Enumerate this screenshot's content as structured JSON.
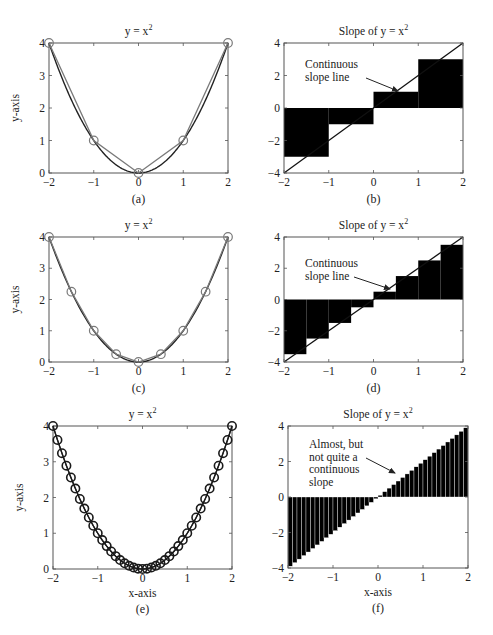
{
  "figure": {
    "width": 493,
    "height": 635,
    "colors": {
      "axis": "#555555",
      "curve": "#222222",
      "approx_gray": "#7a7a7a",
      "bar_fill": "#000000",
      "marker_dark": "#1a1a1a"
    }
  },
  "chart_data": [
    {
      "id": "a",
      "type": "line",
      "caption": "(a)",
      "title": "y = x",
      "title_sup": "2",
      "xlabel": "",
      "ylabel": "y-axis",
      "xlim": [
        -2,
        2
      ],
      "ylim": [
        0,
        4
      ],
      "xticks": [
        -2,
        -1,
        0,
        1,
        2
      ],
      "yticks": [
        0,
        1,
        2,
        3,
        4
      ],
      "xtick_labels": [
        "−2",
        "−1",
        "0",
        "1",
        "2"
      ],
      "ytick_labels": [
        "0",
        "1",
        "2",
        "3",
        "4"
      ],
      "box": {
        "x": 49,
        "y": 43,
        "w": 179,
        "h": 130
      },
      "grid": false,
      "series": [
        {
          "name": "y = x^2 (continuous)",
          "style": "curve",
          "function": "x^2"
        },
        {
          "name": "sampled points",
          "style": "markers-gray",
          "x": [
            -2,
            -1,
            0,
            1,
            2
          ],
          "y": [
            4,
            1,
            0,
            1,
            4
          ]
        }
      ]
    },
    {
      "id": "b",
      "type": "bar",
      "caption": "(b)",
      "title": "Slope of y = x",
      "title_sup": "2",
      "xlabel": "",
      "ylabel": "",
      "xlim": [
        -2,
        2
      ],
      "ylim": [
        -4,
        4
      ],
      "xticks": [
        -2,
        -1,
        0,
        1,
        2
      ],
      "yticks": [
        -4,
        -2,
        0,
        2,
        4
      ],
      "xtick_labels": [
        "−2",
        "−1",
        "0",
        "1",
        "2"
      ],
      "ytick_labels": [
        "−4",
        "−2",
        "0",
        "2",
        "4"
      ],
      "box": {
        "x": 284,
        "y": 43,
        "w": 179,
        "h": 130
      },
      "grid": false,
      "bars": {
        "x_start": [
          -2,
          -1,
          0,
          1
        ],
        "width": 1,
        "values": [
          -3,
          -1,
          1,
          3
        ]
      },
      "slope_line": {
        "x": [
          -2,
          2
        ],
        "y": [
          -4,
          4
        ],
        "label": "y' = 2x"
      },
      "annotation": {
        "lines": [
          "Continuous",
          "slope line"
        ],
        "text_x": 305,
        "text_y": 68,
        "arrow_from": [
          366,
          78
        ],
        "arrow_to": [
          398,
          91
        ]
      }
    },
    {
      "id": "c",
      "type": "line",
      "caption": "(c)",
      "title": "y = x",
      "title_sup": "2",
      "xlabel": "",
      "ylabel": "y-axis",
      "xlim": [
        -2,
        2
      ],
      "ylim": [
        0,
        4
      ],
      "xticks": [
        -2,
        -1,
        0,
        1,
        2
      ],
      "yticks": [
        0,
        1,
        2,
        3,
        4
      ],
      "xtick_labels": [
        "−2",
        "−1",
        "0",
        "1",
        "2"
      ],
      "ytick_labels": [
        "0",
        "1",
        "2",
        "3",
        "4"
      ],
      "box": {
        "x": 49,
        "y": 237,
        "w": 179,
        "h": 125
      },
      "grid": false,
      "series": [
        {
          "name": "y = x^2 (continuous)",
          "style": "curve",
          "function": "x^2"
        },
        {
          "name": "sampled points",
          "style": "markers-gray",
          "x": [
            -2,
            -1.5,
            -1,
            -0.5,
            0,
            0.5,
            1,
            1.5,
            2
          ],
          "y": [
            4,
            2.25,
            1,
            0.25,
            0,
            0.25,
            1,
            2.25,
            4
          ]
        }
      ]
    },
    {
      "id": "d",
      "type": "bar",
      "caption": "(d)",
      "title": "Slope of y = x",
      "title_sup": "2",
      "xlabel": "",
      "ylabel": "",
      "xlim": [
        -2,
        2
      ],
      "ylim": [
        -4,
        4
      ],
      "xticks": [
        -2,
        -1,
        0,
        1,
        2
      ],
      "yticks": [
        -4,
        -2,
        0,
        2,
        4
      ],
      "xtick_labels": [
        "−2",
        "−1",
        "0",
        "1",
        "2"
      ],
      "ytick_labels": [
        "−4",
        "−2",
        "0",
        "2",
        "4"
      ],
      "box": {
        "x": 284,
        "y": 237,
        "w": 179,
        "h": 125
      },
      "grid": false,
      "bars": {
        "x_start": [
          -2,
          -1.5,
          -1,
          -0.5,
          0,
          0.5,
          1,
          1.5
        ],
        "width": 0.5,
        "values": [
          -3.5,
          -2.5,
          -1.5,
          -0.5,
          0.5,
          1.5,
          2.5,
          3.5
        ]
      },
      "slope_line": {
        "x": [
          -2,
          2
        ],
        "y": [
          -4,
          4
        ],
        "label": "y' = 2x"
      },
      "annotation": {
        "lines": [
          "Continuous",
          "slope line"
        ],
        "text_x": 305,
        "text_y": 267,
        "arrow_from": [
          354,
          277
        ],
        "arrow_to": [
          390,
          289
        ]
      }
    },
    {
      "id": "e",
      "type": "line",
      "caption": "(e)",
      "title": "y = x",
      "title_sup": "2",
      "xlabel": "x-axis",
      "ylabel": "y-axis",
      "xlim": [
        -2,
        2
      ],
      "ylim": [
        0,
        4
      ],
      "xticks": [
        -2,
        -1,
        0,
        1,
        2
      ],
      "yticks": [
        0,
        1,
        2,
        3,
        4
      ],
      "xtick_labels": [
        "−2",
        "−1",
        "0",
        "1",
        "2"
      ],
      "ytick_labels": [
        "0",
        "1",
        "2",
        "3",
        "4"
      ],
      "box": {
        "x": 53,
        "y": 426,
        "w": 179,
        "h": 143
      },
      "grid": false,
      "series": [
        {
          "name": "y = x^2 (continuous)",
          "style": "curve",
          "function": "x^2"
        },
        {
          "name": "sampled points",
          "style": "markers-dark",
          "x_range": [
            -2,
            2
          ],
          "x_step": 0.1,
          "function": "x^2",
          "count": 41
        }
      ]
    },
    {
      "id": "f",
      "type": "bar",
      "caption": "(f)",
      "title": "Slope of y = x",
      "title_sup": "2",
      "xlabel": "x-axis",
      "ylabel": "",
      "xlim": [
        -2,
        2
      ],
      "ylim": [
        -4,
        4
      ],
      "xticks": [
        -2,
        -1,
        0,
        1,
        2
      ],
      "yticks": [
        -4,
        -2,
        0,
        2,
        4
      ],
      "xtick_labels": [
        "−2",
        "−1",
        "0",
        "1",
        "2"
      ],
      "ytick_labels": [
        "−4",
        "−2",
        "0",
        "2",
        "4"
      ],
      "box": {
        "x": 288,
        "y": 426,
        "w": 180,
        "h": 142
      },
      "grid": false,
      "bars": {
        "x_range": [
          -2,
          2
        ],
        "width": 0.1,
        "values_rule": "2*(x_start + width/2)",
        "count": 40
      },
      "annotation": {
        "lines": [
          "Almost, but",
          "not quite a",
          "continuous",
          "slope"
        ],
        "text_x": 309,
        "text_y": 448,
        "arrow_from": [
          366,
          458
        ],
        "arrow_to": [
          395,
          473
        ]
      }
    }
  ]
}
